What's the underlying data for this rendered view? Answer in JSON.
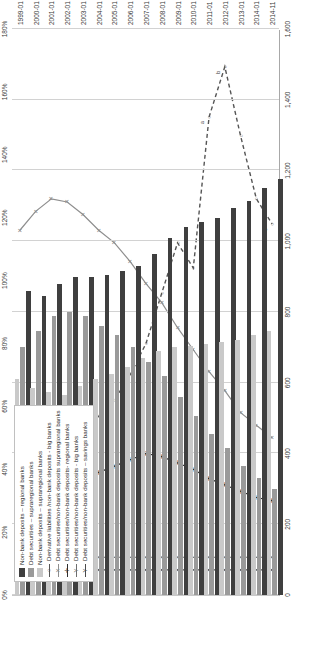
{
  "chart_data": {
    "type": "bar",
    "title": "",
    "xlabel": "",
    "ylabel": "",
    "ylim": [
      0,
      1600
    ],
    "y2lim": [
      0,
      180
    ],
    "grid": true,
    "legend_position": "inside-left",
    "categories": [
      "1999-01",
      "2000-01",
      "2001-01",
      "2002-01",
      "2003-01",
      "2004-01",
      "2005-01",
      "2006-01",
      "2007-01",
      "2008-01",
      "2009-01",
      "2010-01",
      "2011-01",
      "2012-01",
      "2013-01",
      "2014-01",
      "2014-11"
    ],
    "bar_axis_ticks": [
      "0",
      "200",
      "400",
      "600",
      "800",
      "1,000",
      "1,200",
      "1,400",
      "1,600"
    ],
    "pct_axis_ticks": [
      "0%",
      "20%",
      "40%",
      "60%",
      "80%",
      "100%",
      "120%",
      "140%",
      "160%",
      "180%"
    ],
    "series": [
      {
        "name": "Non-bank deposits – regional banks",
        "type": "bar",
        "marker": "square-dark",
        "color": "#3f3f3f",
        "axis": "primary",
        "values": [
          860,
          845,
          880,
          900,
          900,
          905,
          915,
          930,
          965,
          1010,
          1040,
          1055,
          1065,
          1095,
          1115,
          1150,
          1175
        ]
      },
      {
        "name": "Debt securities – supraregional banks",
        "type": "bar",
        "marker": "square-mid",
        "color": "#9a9a9a",
        "axis": "primary",
        "values": [
          700,
          745,
          790,
          800,
          790,
          760,
          735,
          700,
          660,
          620,
          560,
          505,
          455,
          415,
          365,
          330,
          300
        ]
      },
      {
        "name": "Non-bank deposits – supraregional banks",
        "type": "bar",
        "marker": "square-light",
        "color": "#c9c9c9",
        "axis": "primary",
        "values": [
          610,
          585,
          575,
          565,
          590,
          610,
          625,
          645,
          670,
          690,
          700,
          705,
          710,
          715,
          720,
          735,
          745
        ]
      },
      {
        "name": "Derivative liabilities /non-bank deposits - big banks",
        "type": "line",
        "marker": "circle-open",
        "color": "#555555",
        "dash": "dashed",
        "axis": "secondary",
        "values": [
          38,
          36,
          40,
          44,
          50,
          57,
          62,
          70,
          80,
          96,
          112,
          104,
          152,
          168,
          146,
          126,
          118
        ]
      },
      {
        "name": "Debt securities/non-bank deposits supraregional banks",
        "type": "line",
        "marker": "x-cross",
        "color": "#8e8e8e",
        "dash": "solid",
        "axis": "secondary",
        "values": [
          116,
          122,
          126,
          125,
          121,
          116,
          112,
          106,
          99,
          93,
          85,
          78,
          71,
          65,
          58,
          54,
          50
        ]
      },
      {
        "name": "Debt securities/non-bank deposits- regional banks",
        "type": "line",
        "marker": "plus",
        "color": "#2e2e2e",
        "dash": "solid",
        "axis": "secondary",
        "values": [
          44,
          40,
          38,
          38,
          38,
          39,
          41,
          43,
          45,
          44,
          42,
          40,
          37,
          35,
          33,
          31,
          30
        ]
      },
      {
        "name": "Debt securities/non-bank deposits - big banks",
        "type": "line",
        "marker": "y-open",
        "color": "#6e6e6e",
        "dash": "solid",
        "axis": "secondary",
        "values": [
          12,
          12,
          12,
          12,
          12,
          12,
          12,
          12,
          12,
          12,
          12,
          12,
          12,
          12,
          12,
          12,
          12
        ]
      },
      {
        "name": "Debt securities/non-bank deposits – savings banks",
        "type": "line",
        "marker": "y-small",
        "color": "#4a4a4a",
        "dash": "solid",
        "axis": "secondary",
        "values": [
          8,
          8,
          8,
          8,
          8,
          8,
          8,
          8,
          8,
          8,
          8,
          8,
          8,
          8,
          8,
          8,
          8
        ]
      }
    ],
    "annotations": [
      {
        "text": "a",
        "x": "2011-01",
        "axis": "secondary",
        "value": 152
      },
      {
        "text": "b",
        "x": "2012-01",
        "axis": "secondary",
        "value": 168
      },
      {
        "text": "c",
        "x": "2014-11",
        "axis": "secondary",
        "value": 118
      }
    ]
  },
  "legend": {
    "items": [
      {
        "label": "Non-bank deposits – regional banks",
        "marker": "square-dark"
      },
      {
        "label": "Debt securities – supraregional banks",
        "marker": "square-mid"
      },
      {
        "label": "Non-bank deposits – supraregional banks",
        "marker": "square-light"
      },
      {
        "label": "Derivative liabilities /non-bank deposits - big banks",
        "marker": "circle-open"
      },
      {
        "label": "Debt securities/non-bank deposits supraregional banks",
        "marker": "x-cross"
      },
      {
        "label": "Debt securities/non-bank deposits- regional banks",
        "marker": "plus"
      },
      {
        "label": "Debt securities/non-bank deposits - big banks",
        "marker": "y-open"
      },
      {
        "label": "Debt securities/non-bank deposits – savings banks",
        "marker": "y-small"
      }
    ]
  }
}
